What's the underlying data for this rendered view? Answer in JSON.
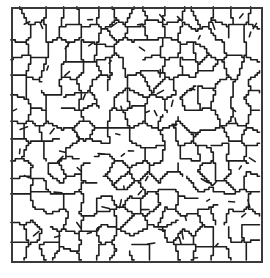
{
  "image": {
    "description": "Square-framed black-and-white micrograph of a branching cellular crack network",
    "background_color": "#ffffff",
    "line_color": "#1e1e1e",
    "frame_color": "#3a3a3a",
    "frame": {
      "x": 12,
      "y": 8,
      "width": 250,
      "height": 254
    },
    "network": {
      "seed": 7,
      "cells": 230,
      "stroke_width": 1.6,
      "break_probability": 0.18,
      "spur_count": 70
    }
  }
}
